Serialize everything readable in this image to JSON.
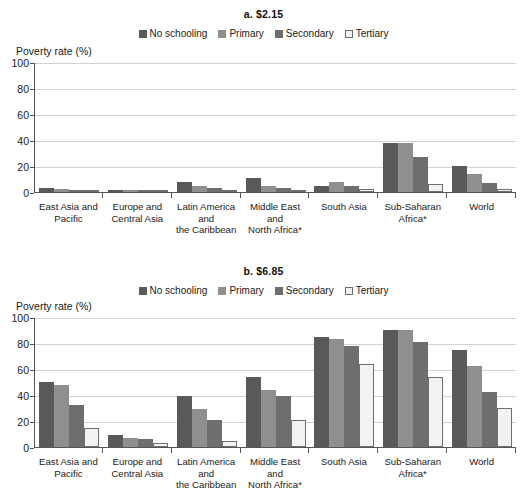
{
  "legend": {
    "items": [
      {
        "label": "No schooling",
        "color": "#595959",
        "border": "#595959"
      },
      {
        "label": "Primary",
        "color": "#8f8f8f",
        "border": "#8f8f8f"
      },
      {
        "label": "Secondary",
        "color": "#6e6e6e",
        "border": "#6e6e6e"
      },
      {
        "label": "Tertiary",
        "color": "#f2f2f2",
        "border": "#6e6e6e"
      }
    ]
  },
  "axis": {
    "y_title": "Poverty rate (%)",
    "y_ticks": [
      "0",
      "20",
      "40",
      "60",
      "80",
      "100"
    ]
  },
  "chart_data": [
    {
      "type": "bar",
      "title": "a. $2.15",
      "xlabel": "",
      "ylabel": "Poverty rate (%)",
      "ylim": [
        0,
        100
      ],
      "yticks": [
        0,
        20,
        40,
        60,
        80,
        100
      ],
      "grid": true,
      "legend_position": "top-center",
      "categories": [
        "East Asia and Pacific",
        "Europe and Central Asia",
        "Latin America and the Caribbean",
        "Middle East and North Africa*",
        "South Asia",
        "Sub-Saharan Africa*",
        "World"
      ],
      "series": [
        {
          "name": "No schooling",
          "values": [
            3,
            1,
            8,
            11,
            5,
            38,
            20
          ]
        },
        {
          "name": "Primary",
          "values": [
            2,
            1,
            5,
            5,
            8,
            38,
            14
          ]
        },
        {
          "name": "Secondary",
          "values": [
            1,
            0,
            3,
            3,
            5,
            27,
            7
          ]
        },
        {
          "name": "Tertiary",
          "values": [
            0,
            0,
            1,
            1,
            2,
            6,
            2
          ]
        }
      ]
    },
    {
      "type": "bar",
      "title": "b. $6.85",
      "xlabel": "",
      "ylabel": "Poverty rate (%)",
      "ylim": [
        0,
        100
      ],
      "yticks": [
        0,
        20,
        40,
        60,
        80,
        100
      ],
      "grid": true,
      "legend_position": "top-center",
      "categories": [
        "East Asia and Pacific",
        "Europe and Central Asia",
        "Latin America and the Caribbean",
        "Middle East and North Africa*",
        "South Asia",
        "Sub-Saharan Africa*",
        "World"
      ],
      "series": [
        {
          "name": "No schooling",
          "values": [
            50,
            9,
            39,
            54,
            85,
            90,
            75
          ]
        },
        {
          "name": "Primary",
          "values": [
            48,
            7,
            29,
            44,
            83,
            90,
            62
          ]
        },
        {
          "name": "Secondary",
          "values": [
            32,
            6,
            21,
            39,
            78,
            81,
            42
          ]
        },
        {
          "name": "Tertiary",
          "values": [
            15,
            3,
            5,
            21,
            64,
            54,
            30
          ]
        }
      ]
    }
  ],
  "x_categories": [
    [
      "East Asia and",
      "Pacific"
    ],
    [
      "Europe and",
      "Central Asia"
    ],
    [
      "Latin America",
      "and",
      "the Caribbean"
    ],
    [
      "Middle East",
      "and",
      "North Africa*"
    ],
    [
      "South Asia"
    ],
    [
      "Sub-Saharan",
      "Africa*"
    ],
    [
      "World"
    ]
  ]
}
